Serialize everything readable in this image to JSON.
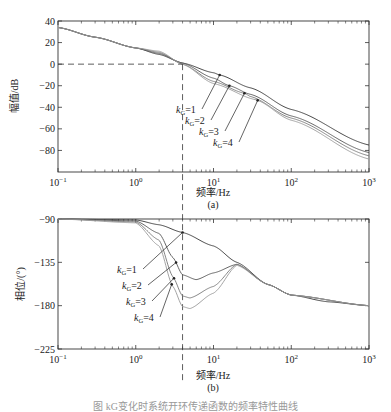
{
  "chart_data": [
    {
      "type": "line",
      "panel_label": "(a)",
      "xlabel": "频率/Hz",
      "ylabel": "幅值/dB",
      "xscale": "log",
      "xlim": [
        0.1,
        1000
      ],
      "ylim": [
        -100,
        40
      ],
      "xticks": [
        "10^-1",
        "10^0",
        "10^1",
        "10^2",
        "10^3"
      ],
      "yticks": [
        40,
        20,
        0,
        -20,
        -40,
        -60,
        -80
      ],
      "grid": false,
      "guide_lines": {
        "horizontal_y": 0,
        "vertical_x": 4
      },
      "series": [
        {
          "name": "kG=1",
          "x": [
            0.1,
            0.3,
            1,
            2,
            4,
            10,
            12,
            30,
            100,
            1000
          ],
          "values": [
            34,
            25,
            15,
            9,
            1,
            -8,
            -10,
            -22,
            -42,
            -75
          ]
        },
        {
          "name": "kG=2",
          "x": [
            0.1,
            0.3,
            1,
            2,
            4,
            10,
            16,
            30,
            100,
            1000
          ],
          "values": [
            34,
            25,
            15,
            10,
            1,
            -13,
            -20,
            -28,
            -48,
            -82
          ]
        },
        {
          "name": "kG=3",
          "x": [
            0.1,
            0.3,
            1,
            2,
            4,
            10,
            25,
            30,
            100,
            1000
          ],
          "values": [
            34,
            25,
            15,
            11,
            0,
            -16,
            -27,
            -30,
            -50,
            -85
          ]
        },
        {
          "name": "kG=4",
          "x": [
            0.1,
            0.3,
            1,
            2,
            4,
            10,
            35,
            100,
            1000
          ],
          "values": [
            34,
            25,
            15,
            12,
            0,
            -18,
            -33,
            -52,
            -88
          ]
        }
      ],
      "annotations": [
        "kG=1",
        "kG=2",
        "kG=3",
        "kG=4"
      ]
    },
    {
      "type": "line",
      "panel_label": "(b)",
      "xlabel": "频率/Hz",
      "ylabel": "相位/(°)",
      "xscale": "log",
      "xlim": [
        0.1,
        1000
      ],
      "ylim": [
        -225,
        -90
      ],
      "xticks": [
        "10^-1",
        "10^0",
        "10^1",
        "10^2",
        "10^3"
      ],
      "yticks": [
        -90,
        -135,
        -180,
        -225
      ],
      "grid": false,
      "guide_lines": {
        "vertical_x": 4
      },
      "series": [
        {
          "name": "kG=1",
          "x": [
            0.1,
            1,
            2,
            4,
            10,
            20,
            50,
            100,
            300,
            1000
          ],
          "values": [
            -90,
            -91,
            -96,
            -104,
            -118,
            -135,
            -158,
            -169,
            -176,
            -180
          ]
        },
        {
          "name": "kG=2",
          "x": [
            0.1,
            1,
            2,
            3,
            4,
            6,
            10,
            20,
            50,
            100,
            1000
          ],
          "values": [
            -90,
            -92,
            -105,
            -130,
            -148,
            -153,
            -146,
            -137,
            -158,
            -169,
            -180
          ]
        },
        {
          "name": "kG=3",
          "x": [
            0.1,
            1,
            2,
            3,
            4,
            5,
            10,
            20,
            50,
            100,
            1000
          ],
          "values": [
            -90,
            -93,
            -112,
            -150,
            -170,
            -172,
            -160,
            -137,
            -158,
            -169,
            -180
          ]
        },
        {
          "name": "kG=4",
          "x": [
            0.1,
            1,
            2,
            3,
            4,
            5,
            10,
            20,
            50,
            100,
            1000
          ],
          "values": [
            -90,
            -94,
            -118,
            -160,
            -181,
            -183,
            -167,
            -138,
            -158,
            -169,
            -180
          ]
        }
      ],
      "annotations": [
        "kG=1",
        "kG=2",
        "kG=3",
        "kG=4"
      ]
    }
  ],
  "top": {
    "ylabel": "幅值/dB",
    "yticks": [
      "40",
      "20",
      "0",
      "−20",
      "−40",
      "−60",
      "−80"
    ],
    "xlabel": "频率/Hz",
    "panel": "(a)"
  },
  "bottom": {
    "ylabel": "相位/(°)",
    "yticks": [
      "−90",
      "−135",
      "−180",
      "−225"
    ],
    "xlabel": "频率/Hz",
    "panel": "(b)"
  },
  "xticks": {
    "base": "10",
    "exps": [
      "−1",
      "0",
      "1",
      "2",
      "3"
    ]
  },
  "labels": {
    "k": "k",
    "sub": "G",
    "vals": [
      "=1",
      "=2",
      "=3",
      "=4"
    ]
  },
  "caption": "图 kG变化时系统开环传递函数的频率特性曲线",
  "colors": {
    "curve1": "#333333",
    "curve2": "#555555",
    "curve3": "#777777",
    "curve4": "#999999"
  }
}
